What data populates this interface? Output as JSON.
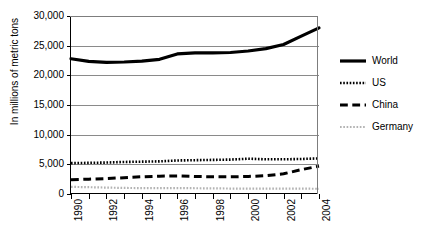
{
  "chart_data": {
    "type": "line",
    "title": "",
    "xlabel": "",
    "ylabel": "In millions of metric tons",
    "x": [
      1990,
      1991,
      1992,
      1993,
      1994,
      1995,
      1996,
      1997,
      1998,
      1999,
      2000,
      2001,
      2002,
      2003,
      2004
    ],
    "xlim": [
      1990,
      2004
    ],
    "ylim": [
      0,
      30000
    ],
    "yticks": [
      0,
      5000,
      10000,
      15000,
      20000,
      25000,
      30000
    ],
    "ytick_labels": [
      "0",
      "5,000",
      "10,000",
      "15,000",
      "20,000",
      "25,000",
      "30,000"
    ],
    "xtick_labels": [
      "1990",
      "",
      "1992",
      "",
      "1994",
      "",
      "1996",
      "",
      "1998",
      "",
      "2000",
      "",
      "2002",
      "",
      "2004"
    ],
    "grid": true,
    "legend_position": "right",
    "series": [
      {
        "name": "World",
        "style": "solid",
        "color": "#000000",
        "width": 3.2,
        "values": [
          22800,
          22350,
          22200,
          22250,
          22400,
          22700,
          23600,
          23800,
          23800,
          23850,
          24100,
          24500,
          25200,
          26600,
          28000
        ]
      },
      {
        "name": "US",
        "style": "dotted",
        "color": "#000000",
        "width": 2.6,
        "values": [
          5200,
          5250,
          5300,
          5400,
          5450,
          5500,
          5650,
          5700,
          5750,
          5800,
          5950,
          5850,
          5850,
          5900,
          6000
        ]
      },
      {
        "name": "China",
        "style": "dashed",
        "color": "#000000",
        "width": 3.0,
        "values": [
          2400,
          2500,
          2600,
          2750,
          2900,
          3000,
          3050,
          2950,
          2900,
          2900,
          2950,
          3100,
          3400,
          4100,
          4700
        ]
      },
      {
        "name": "Germany",
        "style": "fine-dotted",
        "color": "#b3b3b3",
        "width": 2.2,
        "values": [
          1200,
          1150,
          1080,
          1020,
          1000,
          990,
          1000,
          970,
          950,
          920,
          920,
          920,
          900,
          900,
          880
        ]
      }
    ]
  },
  "legend": {
    "items": [
      {
        "label": "World",
        "style": "solid"
      },
      {
        "label": "US",
        "style": "dotted"
      },
      {
        "label": "China",
        "style": "dashed"
      },
      {
        "label": "Germany",
        "style": "fine-dotted"
      }
    ]
  }
}
